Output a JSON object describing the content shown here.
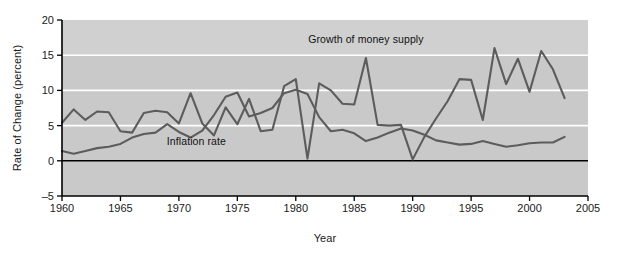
{
  "figure": {
    "background_color": "#ffffff",
    "plot_background_color": "#c9c9c9",
    "plot_background_color_upper": "#d0d0d0",
    "gridline_color": "#ffffff",
    "zero_line_color": "#000000",
    "axis_color": "#000000",
    "series_color": "#5c5c5c"
  },
  "chart_data": {
    "type": "line",
    "title": "",
    "xlabel": "Year",
    "ylabel": "Rate of Change (percent)",
    "xlim": [
      1960,
      2005
    ],
    "ylim": [
      -5,
      20
    ],
    "xticks": [
      1960,
      1965,
      1970,
      1975,
      1980,
      1985,
      1990,
      1995,
      2000,
      2005
    ],
    "yticks": [
      -5,
      0,
      5,
      10,
      15,
      20
    ],
    "gridlines_y": [
      5,
      10,
      15
    ],
    "grid": true,
    "legend_position": "inline-annotation",
    "annotations": [
      {
        "text": "Growth of money supply",
        "x": 1986.0,
        "y": 17.2
      },
      {
        "text": "Inflation rate",
        "x": 1971.5,
        "y": 2.6
      }
    ],
    "series": [
      {
        "name": "Growth of money supply",
        "color": "#5c5c5c",
        "x": [
          1960,
          1961,
          1962,
          1963,
          1964,
          1965,
          1966,
          1967,
          1968,
          1969,
          1970,
          1971,
          1972,
          1973,
          1974,
          1975,
          1976,
          1977,
          1978,
          1979,
          1980,
          1981,
          1982,
          1983,
          1984,
          1985,
          1986,
          1987,
          1988,
          1989,
          1990,
          1991,
          1992,
          1993,
          1994,
          1995,
          1996,
          1997,
          1998,
          1999,
          2000,
          2001,
          2002,
          2003
        ],
        "values": [
          5.4,
          7.3,
          5.8,
          7.0,
          6.9,
          4.2,
          4.0,
          6.8,
          7.1,
          6.9,
          5.3,
          9.6,
          5.3,
          3.6,
          7.6,
          5.2,
          8.8,
          4.2,
          4.4,
          10.6,
          11.6,
          0.3,
          11.0,
          10.0,
          8.1,
          8.0,
          14.6,
          5.1,
          5.0,
          5.1,
          0.2,
          3.4,
          6.0,
          8.5,
          11.6,
          11.5,
          5.8,
          16.0,
          10.9,
          14.5,
          9.8,
          15.6,
          13.0,
          8.9
        ]
      },
      {
        "name": "Inflation rate",
        "color": "#5c5c5c",
        "x": [
          1960,
          1961,
          1962,
          1963,
          1964,
          1965,
          1966,
          1967,
          1968,
          1969,
          1970,
          1971,
          1972,
          1973,
          1974,
          1975,
          1976,
          1977,
          1978,
          1979,
          1980,
          1981,
          1982,
          1983,
          1984,
          1985,
          1986,
          1987,
          1988,
          1989,
          1990,
          1991,
          1992,
          1993,
          1994,
          1995,
          1996,
          1997,
          1998,
          1999,
          2000,
          2001,
          2002,
          2003
        ],
        "values": [
          1.4,
          1.0,
          1.4,
          1.8,
          2.0,
          2.4,
          3.3,
          3.8,
          4.0,
          5.2,
          4.1,
          3.3,
          4.3,
          6.5,
          9.1,
          9.7,
          6.3,
          6.8,
          7.5,
          9.6,
          10.1,
          9.5,
          6.2,
          4.2,
          4.4,
          3.9,
          2.8,
          3.3,
          4.0,
          4.6,
          4.3,
          3.7,
          2.9,
          2.6,
          2.3,
          2.4,
          2.8,
          2.4,
          2.0,
          2.2,
          2.5,
          2.6,
          2.6,
          3.4
        ]
      }
    ]
  }
}
